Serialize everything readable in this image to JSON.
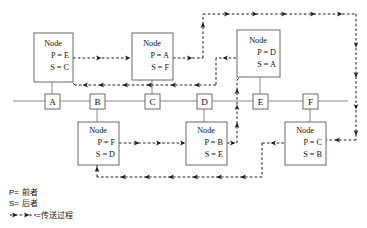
{
  "diagram": {
    "title": "",
    "colors": {
      "flow_arrow": "#1a1a1a",
      "box_stroke": "#6a6a6a",
      "baseline": "#8a8a8a",
      "background": "#ffffff",
      "text": "#111111"
    },
    "node_label": "Node",
    "baseline_boxes": [
      {
        "id": "box-a",
        "label": "A",
        "x": 52,
        "y": 101
      },
      {
        "id": "box-b",
        "label": "B",
        "x": 97,
        "y": 101
      },
      {
        "id": "box-c",
        "label": "C",
        "x": 152,
        "y": 101
      },
      {
        "id": "box-d",
        "label": "D",
        "x": 204,
        "y": 101
      },
      {
        "id": "box-e",
        "label": "E",
        "x": 260,
        "y": 101
      },
      {
        "id": "box-f",
        "label": "F",
        "x": 310,
        "y": 101
      }
    ],
    "nodes": [
      {
        "id": "node-a",
        "attached_to": "A",
        "position": "top",
        "title": "Node",
        "predecessor_line": "P = E",
        "successor_line": "S = C",
        "predecessor": "E",
        "successor": "C"
      },
      {
        "id": "node-c",
        "attached_to": "C",
        "position": "top",
        "title": "Node",
        "predecessor_line": "P = A",
        "successor_line": "S = F",
        "predecessor": "A",
        "successor": "F"
      },
      {
        "id": "node-e",
        "attached_to": "E",
        "position": "top",
        "title": "Node",
        "predecessor_line": "P = D",
        "successor_line": "S = A",
        "predecessor": "D",
        "successor": "A"
      },
      {
        "id": "node-b",
        "attached_to": "B",
        "position": "bottom",
        "title": "Node",
        "predecessor_line": "P = F",
        "successor_line": "S = D",
        "predecessor": "F",
        "successor": "D"
      },
      {
        "id": "node-d",
        "attached_to": "D",
        "position": "bottom",
        "title": "Node",
        "predecessor_line": "P = B",
        "successor_line": "S = E",
        "predecessor": "B",
        "successor": "E"
      },
      {
        "id": "node-f",
        "attached_to": "F",
        "position": "bottom",
        "title": "Node",
        "predecessor_line": "P = C",
        "successor_line": "S = B",
        "predecessor": "C",
        "successor": "B"
      }
    ],
    "legend": {
      "predecessor_key": "P=",
      "predecessor_value": "前者",
      "successor_key": "S=",
      "successor_value": "后者",
      "flow_key": "=",
      "flow_value": "传送过程"
    }
  }
}
